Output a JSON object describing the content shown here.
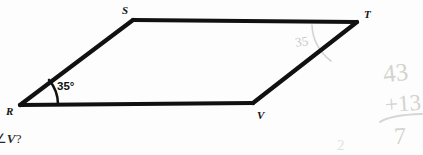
{
  "figure": {
    "shape_name": "parallelogram-rstv",
    "stroke_color": "#111111",
    "pencil_color": "#c9cac5",
    "vertices": [
      {
        "id": "R",
        "label": "R",
        "x": 20,
        "y": 105,
        "label_x": 6,
        "label_y": 106
      },
      {
        "id": "S",
        "label": "S",
        "x": 133,
        "y": 20,
        "label_x": 122,
        "label_y": 5
      },
      {
        "id": "T",
        "label": "T",
        "x": 357,
        "y": 22,
        "label_x": 364,
        "label_y": 9
      },
      {
        "id": "V",
        "label": "V",
        "x": 253,
        "y": 103,
        "label_x": 257,
        "label_y": 110
      }
    ],
    "edges": [
      {
        "name": "edge-r-s",
        "from": "R",
        "to": "S"
      },
      {
        "name": "edge-s-t",
        "from": "S",
        "to": "T"
      },
      {
        "name": "edge-t-v",
        "from": "T",
        "to": "V"
      },
      {
        "name": "edge-v-r",
        "from": "V",
        "to": "R"
      }
    ],
    "angle_marks": [
      {
        "name": "angle-mark-r",
        "at_vertex": "R",
        "label": "35°",
        "label_x": 57,
        "label_y": 81,
        "style": "printed",
        "color": "#111111"
      },
      {
        "name": "angle-mark-t",
        "at_vertex": "T",
        "label": "35",
        "label_x": 295,
        "label_y": 35,
        "style": "handwritten-pencil",
        "color": "#c8c9c4"
      }
    ]
  },
  "question": {
    "visible_text": "re of ∠V?",
    "prefix": "re of ∠",
    "variable": "V",
    "suffix": "?"
  },
  "scratch_work": {
    "line1": "43",
    "line2": "+13",
    "result": "7",
    "stray_mark": "2"
  }
}
